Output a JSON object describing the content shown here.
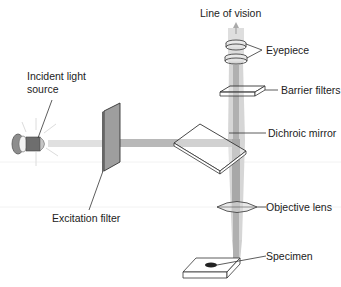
{
  "diagram": {
    "labels": {
      "line_of_vision": "Line of vision",
      "eyepiece": "Eyepiece",
      "barrier_filters": "Barrier filters",
      "incident_light_line1": "Incident light",
      "incident_light_line2": "source",
      "dichroic_mirror": "Dichroic mirror",
      "excitation_filter": "Excitation filter",
      "objective_lens": "Objective lens",
      "specimen": "Specimen"
    },
    "colors": {
      "beam_excitation": "#b5b5b5",
      "beam_emission": "#d4d4d4",
      "beam_core": "#a8a8a8",
      "filter_fill": "#a0a0a0",
      "outline": "#333333",
      "specimen_dot": "#222222"
    }
  }
}
